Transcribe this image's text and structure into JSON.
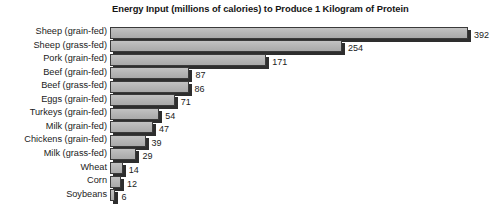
{
  "chart_data": {
    "type": "bar",
    "orientation": "horizontal",
    "title": "Energy Input (millions of calories) to Produce 1 Kilogram of Protein",
    "xlabel": "",
    "ylabel": "",
    "xlim": [
      0,
      400
    ],
    "grid": false,
    "legend": null,
    "units": "millions of calories",
    "categories": [
      "Sheep (grain-fed)",
      "Sheep (grass-fed)",
      "Pork (grain-fed)",
      "Beef (grain-fed)",
      "Beef (grass-fed)",
      "Eggs (grain-fed)",
      "Turkeys (grain-fed)",
      "Milk (grain-fed)",
      "Chickens (grain-fed)",
      "Milk (grass-fed)",
      "Wheat",
      "Corn",
      "Soybeans"
    ],
    "values": [
      392,
      254,
      171,
      87,
      86,
      71,
      54,
      47,
      39,
      29,
      14,
      12,
      6
    ],
    "value_labels": [
      "392",
      "254",
      "171",
      "87",
      "86",
      "71",
      "54",
      "47",
      "39",
      "29",
      "12",
      "12",
      "6"
    ],
    "bar_fill_color": "#b4b4b4",
    "bar_edge_color": "#3a3a3a",
    "bar_shadow_color": "#2e2e2e",
    "background_color": "#ffffff",
    "text_color": "#1b1b1b"
  }
}
